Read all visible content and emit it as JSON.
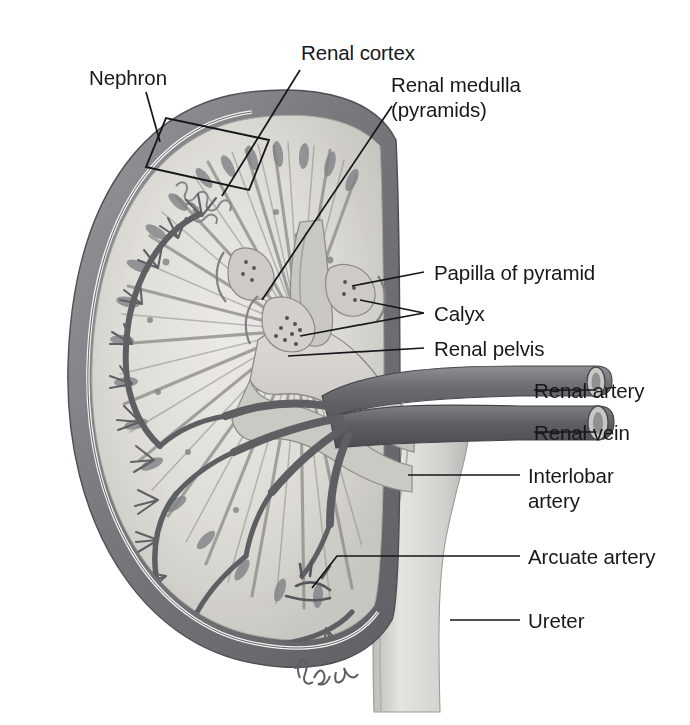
{
  "figure": {
    "signature": "tina",
    "palette": {
      "background": "#ffffff",
      "capsule_dark": "#6f7174",
      "capsule_mid": "#8a8d90",
      "cortex_light": "#d9d7d2",
      "medulla_mid": "#bcbab5",
      "pelvis_light": "#cfcdc8",
      "vessel_dark": "#5a5c60",
      "vessel_mid": "#7c7e82",
      "ureter_light": "#ceccc8",
      "ink": "#15161a"
    }
  },
  "labels": [
    {
      "id": "nephron",
      "text": "Nephron",
      "line2": ""
    },
    {
      "id": "renal-cortex",
      "text": "Renal cortex",
      "line2": ""
    },
    {
      "id": "renal-medulla",
      "text": "Renal medulla",
      "line2": "(pyramids)"
    },
    {
      "id": "papilla",
      "text": "Papilla of pyramid",
      "line2": ""
    },
    {
      "id": "calyx",
      "text": "Calyx",
      "line2": ""
    },
    {
      "id": "renal-pelvis",
      "text": "Renal pelvis",
      "line2": ""
    },
    {
      "id": "renal-artery",
      "text": "Renal artery",
      "line2": ""
    },
    {
      "id": "renal-vein",
      "text": "Renal vein",
      "line2": ""
    },
    {
      "id": "interlobar-artery",
      "text": "Interlobar",
      "line2": "artery"
    },
    {
      "id": "arcuate-artery",
      "text": "Arcuate artery",
      "line2": ""
    },
    {
      "id": "ureter",
      "text": "Ureter",
      "line2": ""
    }
  ],
  "structures": [
    {
      "id": "renal-capsule",
      "name": "Renal capsule"
    },
    {
      "id": "renal-cortex",
      "name": "Renal cortex"
    },
    {
      "id": "renal-medulla",
      "name": "Renal medulla (pyramids)"
    },
    {
      "id": "renal-papilla",
      "name": "Papilla of pyramid"
    },
    {
      "id": "minor-calyx",
      "name": "Calyx"
    },
    {
      "id": "renal-pelvis",
      "name": "Renal pelvis"
    },
    {
      "id": "renal-artery",
      "name": "Renal artery"
    },
    {
      "id": "renal-vein",
      "name": "Renal vein"
    },
    {
      "id": "interlobar-artery",
      "name": "Interlobar artery"
    },
    {
      "id": "arcuate-artery",
      "name": "Arcuate artery"
    },
    {
      "id": "ureter",
      "name": "Ureter"
    },
    {
      "id": "nephron-region",
      "name": "Nephron"
    }
  ]
}
